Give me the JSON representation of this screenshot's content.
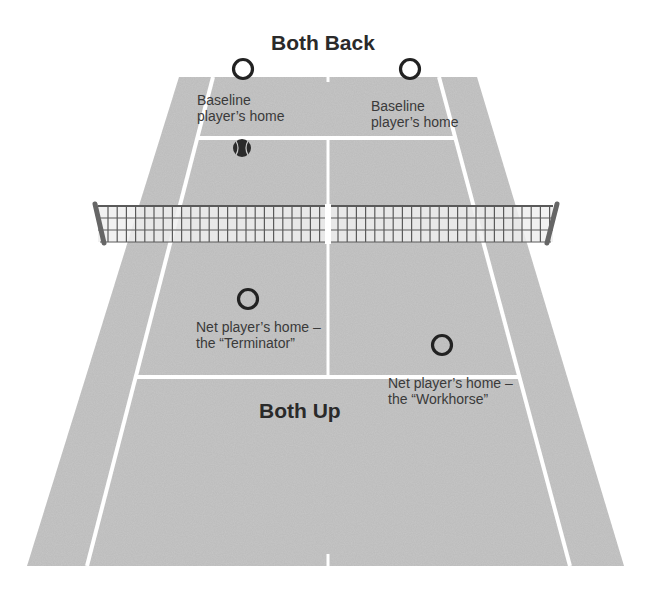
{
  "diagram": {
    "title_top": "Both Back",
    "title_bottom": "Both Up",
    "labels": {
      "baseline_left_1": "Baseline",
      "baseline_left_2": "player’s home",
      "baseline_right_1": "Baseline",
      "baseline_right_2": "player’s home",
      "net_left_1": "Net player’s home –",
      "net_left_2": "the “Terminator”",
      "net_right_1": "Net player’s home –",
      "net_right_2": "the “Workhorse”"
    },
    "markers": [
      {
        "name": "baseline-left-position",
        "cx": 243,
        "cy": 69
      },
      {
        "name": "baseline-right-position",
        "cx": 410,
        "cy": 69
      },
      {
        "name": "net-left-position",
        "cx": 248,
        "cy": 299
      },
      {
        "name": "net-right-position",
        "cx": 442,
        "cy": 345
      }
    ],
    "ball": {
      "cx": 242,
      "cy": 148
    },
    "colors": {
      "court": "#c6c6c6",
      "lines": "#ffffff",
      "net_mesh": "#5a5a5a",
      "net_fill": "#eeeeee",
      "post": "#6a6a6a",
      "text": "#3a3a3a"
    }
  }
}
